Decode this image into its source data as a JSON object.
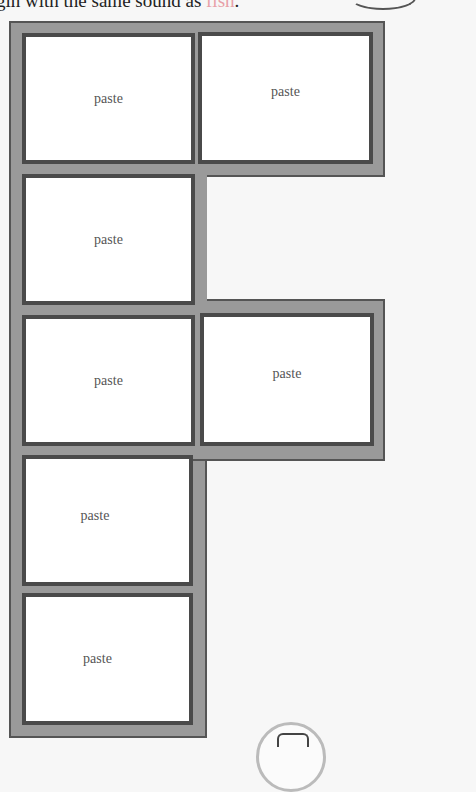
{
  "instruction": {
    "text_before": "gin with the same sound as ",
    "keyword": "fish",
    "text_after": ".",
    "keyword_color": "#e8a0a8"
  },
  "decorations": {
    "top_right": "fish-illustration",
    "bottom_center": "circle-icon"
  },
  "colors": {
    "frame_fill": "#9a9a9a",
    "cell_border": "#4a4a4a",
    "cell_fill": "#ffffff"
  },
  "cells": [
    {
      "label": "paste",
      "row": 1,
      "col": 1
    },
    {
      "label": "paste",
      "row": 1,
      "col": 2
    },
    {
      "label": "paste",
      "row": 2,
      "col": 1
    },
    {
      "label": "paste",
      "row": 3,
      "col": 1
    },
    {
      "label": "paste",
      "row": 3,
      "col": 2
    },
    {
      "label": "paste",
      "row": 4,
      "col": 1
    },
    {
      "label": "paste",
      "row": 5,
      "col": 1
    }
  ]
}
